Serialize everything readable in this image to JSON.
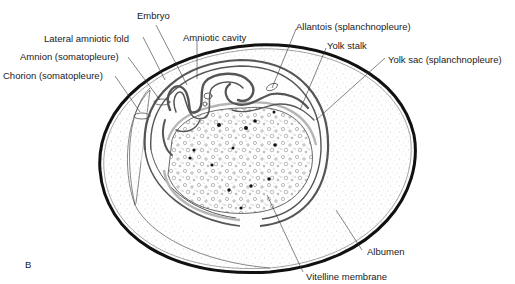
{
  "figure": {
    "panel_label": "B"
  },
  "labels": {
    "embryo": "Embryo",
    "lateral_amniotic_fold": "Lateral amniotic fold",
    "amniotic_cavity": "Amniotic cavity",
    "amnion": "Amnion (somatopleure)",
    "chorion": "Chorion (somatopleure)",
    "allantois": "Allantois (splanchnopleure)",
    "yolk_stalk": "Yolk stalk",
    "yolk_sac": "Yolk sac (splanchnopleure)",
    "albumen": "Albumen",
    "vitelline_membrane": "Vitelline membrane"
  },
  "colors": {
    "shell": "#111111",
    "membrane": "#555555",
    "light_membrane": "#b5b5b5",
    "stipple": "#9a9a9a",
    "text": "#1a1a1a"
  }
}
